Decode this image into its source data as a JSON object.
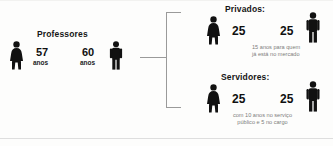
{
  "infographic": {
    "left_group": {
      "title": "Professores",
      "female": {
        "icon": "woman-figure-icon",
        "value": "57",
        "unit": "anos"
      },
      "male": {
        "icon": "man-figure-icon",
        "value": "60",
        "unit": "anos"
      }
    },
    "bracket": {
      "icon": "right-facing-bracket-icon"
    },
    "right_groups": [
      {
        "title": "Privados:",
        "female": {
          "icon": "woman-figure-icon",
          "value": "25"
        },
        "male": {
          "icon": "man-figure-icon",
          "value": "25"
        },
        "caption_line1": "15 anos para quem",
        "caption_line2": "já está no mercado"
      },
      {
        "title": "Servidores:",
        "female": {
          "icon": "woman-figure-icon",
          "value": "25"
        },
        "male": {
          "icon": "man-figure-icon",
          "value": "25"
        },
        "caption_line1": "com 10 anos no serviço",
        "caption_line2": "público e 5 no cargo"
      }
    ]
  },
  "colors": {
    "figure": "#111111",
    "background": "#fdfdfc",
    "caption_gray": "#7d7d7d",
    "bracket_gray": "#9a9a9a"
  }
}
